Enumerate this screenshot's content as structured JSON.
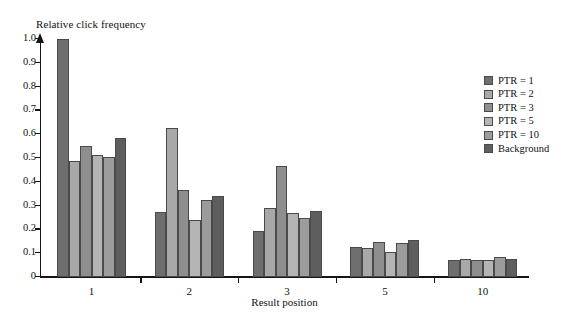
{
  "chart_data": {
    "type": "bar",
    "title": "",
    "xlabel": "Result position",
    "ylabel": "Relative click frequency",
    "categories": [
      "1",
      "2",
      "3",
      "5",
      "10"
    ],
    "ylim": [
      0,
      1.0
    ],
    "yticks": [
      0,
      0.1,
      0.2,
      0.3,
      0.4,
      0.5,
      0.6,
      0.7,
      0.8,
      0.9,
      1.0
    ],
    "ytick_labels": [
      "0",
      "0.1",
      "0.2",
      "0.3",
      "0.4",
      "0.5",
      "0.6",
      "0.7",
      "0.8",
      "0.9",
      "1.0"
    ],
    "grid": false,
    "legend_position": "right",
    "series": [
      {
        "name": "PTR = 1",
        "color": "#6e6e6e",
        "values": [
          1.0,
          0.272,
          0.194,
          0.128,
          0.07
        ]
      },
      {
        "name": "PTR = 2",
        "color": "#a8a8a8",
        "values": [
          0.488,
          0.628,
          0.289,
          0.123,
          0.074
        ]
      },
      {
        "name": "PTR = 3",
        "color": "#8e8e8e",
        "values": [
          0.55,
          0.367,
          0.467,
          0.148,
          0.07
        ]
      },
      {
        "name": "PTR = 5",
        "color": "#b4b4b4",
        "values": [
          0.512,
          0.239,
          0.269,
          0.105,
          0.071
        ]
      },
      {
        "name": "PTR = 10",
        "color": "#9c9c9c",
        "values": [
          0.503,
          0.323,
          0.249,
          0.145,
          0.086
        ]
      },
      {
        "name": "Background",
        "color": "#5e5e5e",
        "values": [
          0.585,
          0.339,
          0.278,
          0.156,
          0.075
        ]
      }
    ]
  },
  "axis": {
    "y_title": "Relative click frequency",
    "x_title": "Result position"
  },
  "legend": {
    "items": [
      {
        "label": "PTR = 1"
      },
      {
        "label": "PTR = 2"
      },
      {
        "label": "PTR = 3"
      },
      {
        "label": "PTR = 5"
      },
      {
        "label": "PTR = 10"
      },
      {
        "label": "Background"
      }
    ]
  }
}
